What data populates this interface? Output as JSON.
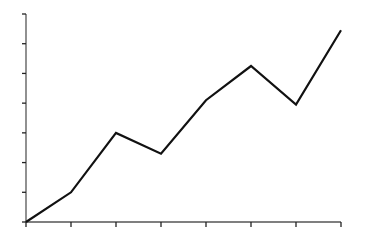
{
  "chart_data": {
    "type": "line",
    "title": "",
    "xlabel": "",
    "ylabel": "",
    "x": [
      0,
      1,
      2,
      3,
      4,
      5,
      6,
      7
    ],
    "series": [
      {
        "name": "series-1",
        "values": [
          0,
          1,
          3,
          2.3,
          4.1,
          5.25,
          3.95,
          6.45
        ],
        "color": "#111111"
      }
    ],
    "xlim": [
      0,
      7
    ],
    "ylim": [
      0,
      7
    ],
    "xticks": [
      0,
      1,
      2,
      3,
      4,
      5,
      6,
      7
    ],
    "yticks": [
      0,
      1,
      2,
      3,
      4,
      5,
      6,
      7
    ],
    "xtick_labels_visible": false,
    "ytick_labels_visible": false,
    "grid": false,
    "legend": "none",
    "axis_color": "#555555"
  }
}
